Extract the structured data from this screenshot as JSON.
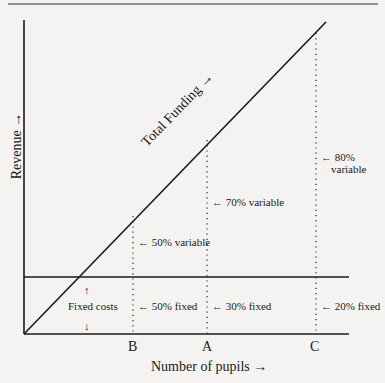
{
  "diagram": {
    "y_axis_label": "Revenue →",
    "x_axis_label": "Number of pupils →",
    "line_label": "Total Funding →",
    "fixed_label": "Fixed costs",
    "fixed_up_arrow": "↑",
    "fixed_down_arrow": "↓",
    "points": [
      {
        "name": "B",
        "variable": "← 50% variable",
        "fixed": "← 50% fixed"
      },
      {
        "name": "A",
        "variable": "← 70% variable",
        "fixed": "← 30% fixed"
      },
      {
        "name": "C",
        "variable_line1": "← 80%",
        "variable_line2": "variable",
        "fixed": "← 20% fixed"
      }
    ]
  }
}
